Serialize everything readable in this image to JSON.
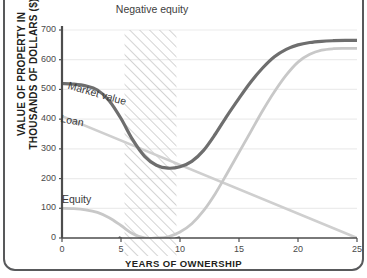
{
  "figure": {
    "annotation": "Negative equity"
  },
  "chart_data": {
    "type": "line",
    "title": "",
    "xlabel": "YEARS OF OWNERSHIP",
    "ylabel": "VALUE OF PROPERTY IN THOUSANDS OF DOLLARS ($)",
    "xlim": [
      0,
      25
    ],
    "ylim": [
      0,
      700
    ],
    "xticks": [
      0,
      5,
      10,
      15,
      20,
      25
    ],
    "yticks": [
      0,
      100,
      200,
      300,
      400,
      500,
      600,
      700
    ],
    "grid": "horizontal",
    "legend": "inline-labels",
    "annotations": [
      {
        "text": "Negative equity",
        "type": "hatched-band",
        "x_start": 5.3,
        "x_end": 9.7
      }
    ],
    "series": [
      {
        "name": "Market value",
        "color": "#6e6e6e",
        "width": 3.2,
        "label_position": {
          "x": 2.0,
          "y": 540
        },
        "x": [
          0,
          1,
          2,
          3,
          4,
          5,
          6,
          7,
          8,
          9,
          10,
          11,
          12,
          13,
          14,
          15,
          16,
          17,
          18,
          19,
          20,
          21,
          22,
          23,
          24,
          25
        ],
        "y": [
          520,
          518,
          512,
          498,
          462,
          402,
          330,
          275,
          245,
          235,
          240,
          258,
          295,
          350,
          412,
          470,
          525,
          572,
          610,
          635,
          650,
          658,
          662,
          664,
          665,
          665
        ]
      },
      {
        "name": "Loan",
        "color": "#cfcfcf",
        "width": 2.6,
        "label_position": {
          "x": 1.6,
          "y": 425
        },
        "x": [
          0,
          25
        ],
        "y": [
          410,
          0
        ]
      },
      {
        "name": "Equity",
        "color": "#c8c8c8",
        "width": 2.8,
        "label_position": {
          "x": 1.6,
          "y": 148
        },
        "x": [
          0,
          1,
          2,
          3,
          4,
          5,
          6,
          7,
          8,
          9,
          10,
          11,
          12,
          13,
          14,
          15,
          16,
          17,
          18,
          19,
          20,
          21,
          22,
          23,
          24,
          25
        ],
        "y": [
          100,
          99,
          95,
          86,
          68,
          42,
          14,
          0,
          0,
          4,
          20,
          48,
          92,
          150,
          218,
          288,
          358,
          428,
          492,
          548,
          592,
          618,
          632,
          637,
          638,
          638
        ]
      }
    ],
    "colors": {
      "market_value": "#6e6e6e",
      "loan": "#cfcfcf",
      "equity": "#c8c8c8",
      "axis": "#4d4d4d",
      "grid": "#ececec",
      "hatch": "#cdcdcd",
      "frame": "#58595b"
    }
  }
}
